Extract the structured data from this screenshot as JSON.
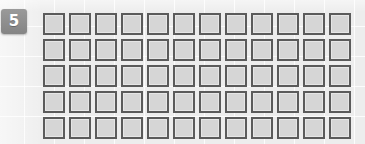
{
  "screen": {
    "width": 365,
    "height": 144,
    "background_color": "#ededed",
    "gridline_color": "#ffffff"
  },
  "badge": {
    "label": "5",
    "background_color": "#8e8e8e",
    "text_color": "#ffffff"
  },
  "board": {
    "columns": 12,
    "rows": 5,
    "tile_count": 60,
    "tile_fill_color": "#d6d6d6",
    "tile_border_color": "#5b5b5b",
    "tiles": [
      [
        "empty",
        "empty",
        "empty",
        "empty",
        "empty",
        "empty",
        "empty",
        "empty",
        "empty",
        "empty",
        "empty",
        "empty"
      ],
      [
        "empty",
        "empty",
        "empty",
        "empty",
        "empty",
        "empty",
        "empty",
        "empty",
        "empty",
        "empty",
        "empty",
        "empty"
      ],
      [
        "empty",
        "empty",
        "empty",
        "empty",
        "empty",
        "empty",
        "empty",
        "empty",
        "empty",
        "empty",
        "empty",
        "empty"
      ],
      [
        "empty",
        "empty",
        "empty",
        "empty",
        "empty",
        "empty",
        "empty",
        "empty",
        "empty",
        "empty",
        "empty",
        "empty"
      ],
      [
        "empty",
        "empty",
        "empty",
        "empty",
        "empty",
        "empty",
        "empty",
        "empty",
        "empty",
        "empty",
        "empty",
        "empty"
      ]
    ]
  }
}
